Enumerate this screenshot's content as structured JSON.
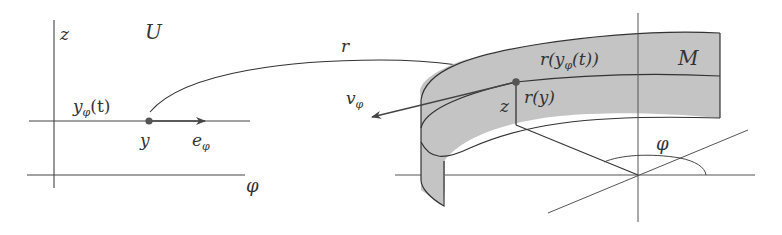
{
  "figure": {
    "type": "mathematical diagram",
    "left_panel": {
      "region_label": "U",
      "vertical_axis_label": "z",
      "horizontal_axis_label": "φ",
      "curve_label_base": "y",
      "curve_label_sub": "φ",
      "curve_label_arg": "(t)",
      "point_label": "y",
      "vector_label_base": "e",
      "vector_label_sub": "φ"
    },
    "map_label": "r",
    "right_panel": {
      "surface_label": "M",
      "image_curve_label_pre": "r(y",
      "image_curve_label_sub": "φ",
      "image_curve_label_post": "(t))",
      "image_point_label": "r(y)",
      "height_label": "z",
      "angle_label": "φ",
      "vector_label_base": "v",
      "vector_label_sub": "φ"
    },
    "colors": {
      "line": "#333333",
      "surface_fill": "#c4c4c4",
      "point": "#555555",
      "background": "#ffffff"
    }
  }
}
